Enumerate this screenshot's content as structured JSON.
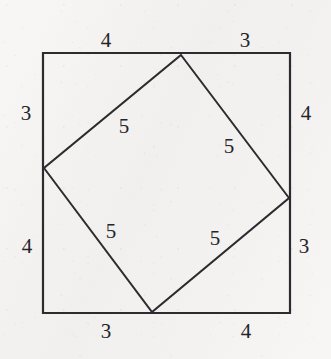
{
  "figure": {
    "type": "geometric-diagram",
    "colors": {
      "background": "#f2f1ef",
      "stroke": "#2b2b30",
      "label_text": "#24242a",
      "fill": "none"
    },
    "canvas": {
      "width": 331,
      "height": 359
    },
    "outer_square": {
      "name": "outer-square",
      "left": 43,
      "top": 53,
      "right": 290,
      "bottom": 313,
      "stroke_width": 2.2,
      "corners": [
        {
          "name": "top-left",
          "x": 43,
          "y": 53
        },
        {
          "name": "top-right",
          "x": 290,
          "y": 53
        },
        {
          "name": "bottom-right",
          "x": 290,
          "y": 313
        },
        {
          "name": "bottom-left",
          "x": 43,
          "y": 313
        }
      ]
    },
    "inner_square": {
      "name": "inner-tilted-square",
      "stroke_width": 2.0,
      "vertices": [
        {
          "name": "top-vertex",
          "x": 181,
          "y": 55
        },
        {
          "name": "right-vertex",
          "x": 289,
          "y": 198
        },
        {
          "name": "bottom-vertex",
          "x": 152,
          "y": 312
        },
        {
          "name": "left-vertex",
          "x": 44,
          "y": 168
        }
      ]
    },
    "segment_labels": [
      {
        "id": "top-left-segment",
        "text": "4",
        "x": 106,
        "y": 40,
        "edge": "top",
        "side": "left"
      },
      {
        "id": "top-right-segment",
        "text": "3",
        "x": 245,
        "y": 40,
        "edge": "top",
        "side": "right"
      },
      {
        "id": "left-upper-segment",
        "text": "3",
        "x": 26,
        "y": 113,
        "edge": "left",
        "side": "upper"
      },
      {
        "id": "left-lower-segment",
        "text": "4",
        "x": 27,
        "y": 246,
        "edge": "left",
        "side": "lower"
      },
      {
        "id": "right-upper-segment",
        "text": "4",
        "x": 306,
        "y": 113,
        "edge": "right",
        "side": "upper"
      },
      {
        "id": "right-lower-segment",
        "text": "3",
        "x": 304,
        "y": 246,
        "edge": "right",
        "side": "lower"
      },
      {
        "id": "bottom-left-segment",
        "text": "3",
        "x": 106,
        "y": 331,
        "edge": "bottom",
        "side": "left"
      },
      {
        "id": "bottom-right-segment",
        "text": "4",
        "x": 246,
        "y": 331,
        "edge": "bottom",
        "side": "right"
      }
    ],
    "hypotenuse_labels": [
      {
        "id": "inner-side-upper-left",
        "text": "5",
        "x": 124,
        "y": 126
      },
      {
        "id": "inner-side-upper-right",
        "text": "5",
        "x": 229,
        "y": 146
      },
      {
        "id": "inner-side-lower-left",
        "text": "5",
        "x": 111,
        "y": 231
      },
      {
        "id": "inner-side-lower-right",
        "text": "5",
        "x": 215,
        "y": 238
      }
    ]
  },
  "chart_data": {
    "type": "diagram",
    "outer_square_side": 7,
    "inner_square_side": 5,
    "leg_a": 3,
    "leg_b": 4,
    "hypotenuse": 5,
    "edge_partitions": {
      "top": [
        4,
        3
      ],
      "right": [
        4,
        3
      ],
      "bottom": [
        3,
        4
      ],
      "left": [
        3,
        4
      ]
    },
    "all_labels": [
      "4",
      "3",
      "3",
      "4",
      "4",
      "3",
      "3",
      "4",
      "5",
      "5",
      "5",
      "5"
    ]
  }
}
